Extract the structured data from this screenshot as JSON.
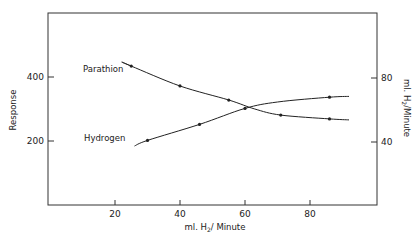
{
  "chart_data": {
    "type": "line",
    "title": "",
    "xlabel": "ml. H2/ Minute",
    "ylabel": "Response",
    "y2label": "ml. H2/Minute",
    "xlim": [
      0,
      100
    ],
    "ylim": [
      0,
      600
    ],
    "y2lim": [
      0,
      120
    ],
    "x_ticks": [
      20,
      40,
      60,
      80
    ],
    "y_ticks": [
      200,
      400
    ],
    "y2_ticks": [
      40,
      80
    ],
    "grid": false,
    "legend": "inline labels with pointer arrows",
    "series": [
      {
        "name": "Parathion",
        "axis": "left",
        "points": [
          [
            25,
            434
          ],
          [
            40,
            372
          ],
          [
            55,
            328
          ],
          [
            71,
            281
          ],
          [
            86,
            269
          ]
        ],
        "curve": [
          [
            22,
            447
          ],
          [
            25,
            434
          ],
          [
            40,
            372
          ],
          [
            55,
            328
          ],
          [
            63,
            300
          ],
          [
            71,
            281
          ],
          [
            86,
            269
          ],
          [
            92,
            266
          ]
        ]
      },
      {
        "name": "Hydrogen",
        "axis": "right",
        "points": [
          [
            30,
            41
          ],
          [
            46,
            51
          ],
          [
            60,
            61
          ],
          [
            86,
            68
          ]
        ],
        "curve": [
          [
            26,
            37.5
          ],
          [
            30,
            41
          ],
          [
            46,
            51
          ],
          [
            60,
            61
          ],
          [
            70,
            65
          ],
          [
            86,
            68
          ],
          [
            92,
            68.5
          ]
        ]
      }
    ]
  },
  "labels": {
    "x_axis_title": "ml. H",
    "x_axis_sub": "2",
    "x_axis_rest": "/ Minute",
    "y_axis_title": "Response",
    "y2_axis_title": "ml. H",
    "y2_axis_sub": "2",
    "y2_axis_rest": "/Minute",
    "series1": "Parathion",
    "series2": "Hydrogen",
    "xt0": "20",
    "xt1": "40",
    "xt2": "60",
    "xt3": "80",
    "yt0": "200",
    "yt1": "400",
    "y2t0": "40",
    "y2t1": "80"
  }
}
